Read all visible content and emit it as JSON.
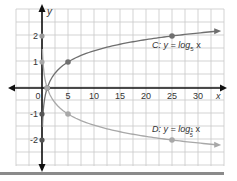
{
  "chart_data": {
    "type": "line",
    "title": "",
    "xlabel": "x",
    "ylabel": "y",
    "xlim": [
      -5,
      35
    ],
    "ylim": [
      -3,
      3
    ],
    "grid": true,
    "x_ticks": [
      0,
      5,
      10,
      15,
      20,
      25,
      30
    ],
    "x_tick_labels": [
      "0",
      "5",
      "10",
      "15",
      "20",
      "25",
      "30"
    ],
    "y_ticks": [
      2,
      1,
      -1,
      -2
    ],
    "y_tick_labels": [
      "2",
      "1",
      "-1",
      "-2"
    ],
    "series": [
      {
        "name": "C",
        "label_prefix": "C: y = log",
        "label_base": "5",
        "label_suffix": " x",
        "function": "log5(x)",
        "color": "#6f6f6f",
        "points": [
          [
            1,
            0
          ],
          [
            5,
            1
          ],
          [
            25,
            2
          ]
        ]
      },
      {
        "name": "D",
        "label_prefix": "D: y = log",
        "label_base_num": "1",
        "label_base_den": "5",
        "label_suffix": " x",
        "function": "log1/5(x)",
        "color": "#a8a8a8",
        "points": [
          [
            1,
            0
          ],
          [
            5,
            -1
          ],
          [
            25,
            -2
          ]
        ]
      }
    ],
    "reflected_points_on_y_axis": [
      {
        "x": 0,
        "y": 2,
        "color": "#9a9a9a"
      },
      {
        "x": 0,
        "y": 1,
        "color": "#a8a8a8"
      },
      {
        "x": 0,
        "y": -1,
        "color": "#555555"
      },
      {
        "x": 0,
        "y": -2,
        "color": "#555555"
      }
    ]
  }
}
